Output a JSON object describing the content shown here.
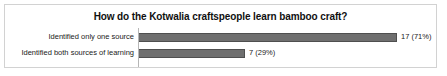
{
  "chart_data": {
    "type": "bar",
    "orientation": "horizontal",
    "title": "How do the Kotwalia craftspeople learn bamboo craft?",
    "categories": [
      "Identified only one source",
      "Identified both sources of learning"
    ],
    "values": [
      17,
      7
    ],
    "percents": [
      71,
      29
    ],
    "data_labels": [
      "17 (71%)",
      "7 (29%)"
    ],
    "xlabel": "",
    "ylabel": "",
    "xlim": [
      0,
      17
    ],
    "grid": false,
    "legend": false,
    "series": [
      {
        "name": "Count",
        "values": [
          17,
          7
        ]
      }
    ],
    "colors": {
      "bar_fill": "#6f6f6f",
      "bar_edge": "#4f4f4f",
      "frame_border": "#d2d2d2",
      "axis_line": "#b6b6b6",
      "title_text": "#101010",
      "label_text": "#1a1a1a",
      "background": "#ffffff"
    }
  }
}
